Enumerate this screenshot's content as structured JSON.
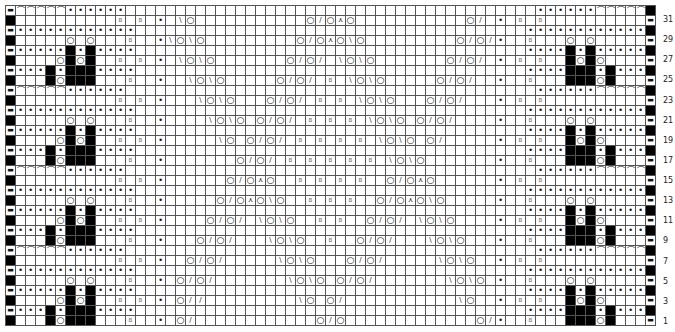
{
  "chart_title": "Lace knitting chart",
  "legend_symbols": {
    "K": "",
    "P": "•",
    "O": "yarn over",
    "/": "k2tog",
    "\\": "ssk",
    "A": "sk2p (central double decrease)",
    "B": "twisted knit (B)",
    "X": "no stitch (black)",
    "-": "purl on edge",
    "C": "purl-bump arc"
  },
  "glyphs": {
    "P": "•",
    "O": "○",
    "/": "/",
    "\\": "\\",
    "A": "⋏",
    "B": "B",
    "-": "▬",
    "C": "⌒",
    "K": "",
    "X": ""
  },
  "grid": {
    "columns": 65,
    "rows": 32,
    "row_labels": [
      31,
      29,
      27,
      25,
      23,
      21,
      19,
      17,
      15,
      13,
      11,
      9,
      7,
      5,
      3,
      1
    ],
    "rows_top_to_bottom": [
      {
        "row": 32,
        "cells": "-CCCCCPPPPPP.......................................PPXXXXXPPPPX"
      },
      {
        "row": 31,
        "cells": "X..........B.B.P.\\O...........O/OAO...........\\O.P.B.B...........-"
      },
      {
        "row": 30,
        "cells": "-PPPPPPPPPPPP........................................PPPPPPPPPPPPX"
      },
      {
        "row": 29,
        "cells": "X.....O.O....B..P\\O\\O........O/OAO\\O........O/O/P..B....O.O.....-"
      },
      {
        "row": 28,
        "cells": "-PPPPPXPXPP.........................................PPXPXPPPPPX"
      },
      {
        "row": 27,
        "cells": "X....OXOX...B.B.P.\\O\\O......O/O/.\\O\\O......O/O/.P.B.B...XOXO....-"
      },
      {
        "row": 26,
        "cells": "-PPPXPXXXPP.........................................PPXXXPXPPPX"
      },
      {
        "row": 25,
        "cells": "X...XOXXX....B..P..\\O\\O....O/O/.B.\\O\\O....O/O/..P..B....XXXOX...-"
      }
    ]
  },
  "row_pattern_note": "8-row repeat; rows 24-17, 16-9, 8-1 follow the same structure with the diagonal lace lines continuing"
}
